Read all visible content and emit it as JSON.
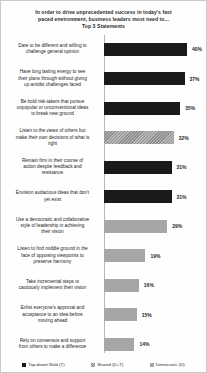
{
  "chart_data": {
    "type": "bar",
    "orientation": "horizontal",
    "title": "In order to drive unprecedented success in today's fast paced environment, business leaders most need to... Top 3 Statements",
    "title_lines": [
      "In order to drive unprecedented success in today's fast",
      "paced environment, business leaders most need to...",
      "Top 3 Statements"
    ],
    "xlabel": "",
    "ylabel": "",
    "xlim": [
      0,
      45
    ],
    "grid": false,
    "legend_position": "bottom",
    "categories": [
      "Dare to be different and willing to challenge  general opinion",
      "Have long lasting energy to see their plans through without giving up amidst challenges faced",
      "Be bold risk-takers  that pursue unpopular or unconventional ideas to break new ground",
      "Listen to the views of others but make their own decisions of what is right",
      "Remain firm in their course of action despite feedback and resistance",
      "Envision audacious ideas that don't yet exist",
      "Use a democratic and collaborative style of leadership  in achieving their vision",
      "Listen to find middle ground in the face of opposing viewpoints  to preserve harmony",
      "Take incremental steps to cautiously implement their vision",
      "Enlist everyone's approval and acceptance to an idea before moving ahead",
      "Rely on consensus and support from others to make a difference"
    ],
    "values": [
      40,
      37,
      35,
      32,
      31,
      31,
      29,
      19,
      16,
      15,
      14
    ],
    "value_labels": [
      "40%",
      "37%",
      "35%",
      "32%",
      "31%",
      "31%",
      "29%",
      "19%",
      "16%",
      "15%",
      "14%"
    ],
    "series_key": [
      "dark",
      "dark",
      "dark",
      "hatch",
      "dark",
      "dark",
      "gray",
      "gray",
      "gray",
      "gray",
      "gray"
    ],
    "legend": [
      {
        "label": "Top-down/ Bold (T)",
        "style": "dark",
        "color": "#1a1a1a"
      },
      {
        "label": "Shared (D+T)",
        "style": "hatch",
        "color": "#8e8e8e"
      },
      {
        "label": "Democratic (D)",
        "style": "gray",
        "color": "#a6a6a6"
      }
    ]
  },
  "rows": [
    {
      "label": "Dare to be different and willing to challenge  general opinion",
      "label_lines": [
        "Dare to be different and willing to",
        "challenge  general opinion"
      ],
      "value": 40,
      "value_label": "40%",
      "style": "dark"
    },
    {
      "label": "Have long lasting energy to see their plans through without giving up amidst challenges faced",
      "label_lines": [
        "Have long lasting energy to see",
        "their plans through without giving",
        "up amidst challenges faced"
      ],
      "value": 37,
      "value_label": "37%",
      "style": "dark"
    },
    {
      "label": "Be bold risk-takers  that pursue unpopular or unconventional ideas to break new ground",
      "label_lines": [
        "Be bold risk-takers  that pursue",
        "unpopular or unconventional ideas",
        "to break new ground"
      ],
      "value": 35,
      "value_label": "35%",
      "style": "dark"
    },
    {
      "label": "Listen to the views of others but make their own decisions of what is right",
      "label_lines": [
        "Listen to the views of others but",
        "make their own decisions of what is",
        "right"
      ],
      "value": 32,
      "value_label": "32%",
      "style": "hatch"
    },
    {
      "label": "Remain firm in their course of action despite feedback and resistance",
      "label_lines": [
        "Remain firm in their course of",
        "action despite feedback and",
        "resistance"
      ],
      "value": 31,
      "value_label": "31%",
      "style": "dark"
    },
    {
      "label": "Envision audacious ideas that don't yet exist",
      "label_lines": [
        "Envision audacious ideas that don't",
        "yet exist"
      ],
      "value": 31,
      "value_label": "31%",
      "style": "dark"
    },
    {
      "label": "Use a democratic and collaborative style of leadership  in achieving their vision",
      "label_lines": [
        "Use a democratic and collaborative",
        "style of leadership  in achieving",
        "their vision"
      ],
      "value": 29,
      "value_label": "29%",
      "style": "gray"
    },
    {
      "label": "Listen to find middle ground in the face of opposing viewpoints  to preserve harmony",
      "label_lines": [
        "Listen to find middle ground in the",
        "face of opposing viewpoints  to",
        "preserve harmony"
      ],
      "value": 19,
      "value_label": "19%",
      "style": "gray"
    },
    {
      "label": "Take incremental steps to cautiously implement their vision",
      "label_lines": [
        "Take incremental steps to",
        "cautiously implement their vision"
      ],
      "value": 16,
      "value_label": "16%",
      "style": "gray"
    },
    {
      "label": "Enlist everyone's approval and acceptance to an idea before moving ahead",
      "label_lines": [
        "Enlist everyone's approval and",
        "acceptance to an idea before",
        "moving ahead"
      ],
      "value": 15,
      "value_label": "15%",
      "style": "gray"
    },
    {
      "label": "Rely on consensus and support from others to make a difference",
      "label_lines": [
        "Rely on consensus and support",
        "from others to make a difference"
      ],
      "value": 14,
      "value_label": "14%",
      "style": "gray"
    }
  ]
}
